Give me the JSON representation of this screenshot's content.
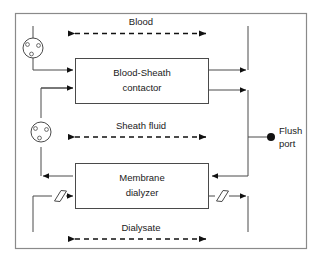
{
  "diagram": {
    "frame": {
      "name": "outer-frame"
    },
    "blocks": [
      {
        "id": "blood-sheath-contactor",
        "line1": "Blood-Sheath",
        "line2": "contactor"
      },
      {
        "id": "membrane-dialyzer",
        "line1": "Membrane",
        "line2": "dialyzer"
      }
    ],
    "flow_labels": [
      {
        "id": "blood",
        "text": "Blood"
      },
      {
        "id": "sheath-fluid",
        "text": "Sheath fluid"
      },
      {
        "id": "dialysate",
        "text": "Dialysate"
      }
    ],
    "ports": [
      {
        "id": "flush-port",
        "line1": "Flush",
        "line2": "port"
      }
    ],
    "pumps": [
      {
        "id": "blood-pump"
      },
      {
        "id": "sheath-pump"
      }
    ],
    "restrictors": [
      {
        "id": "dialysate-inlet-restrictor"
      },
      {
        "id": "dialysate-outlet-restrictor"
      }
    ],
    "colors": {
      "line": "#4a4a4a",
      "dashed": "#111111",
      "frame": "#8a8a8a",
      "text": "#1a1a1a",
      "background": "#ffffff"
    }
  }
}
